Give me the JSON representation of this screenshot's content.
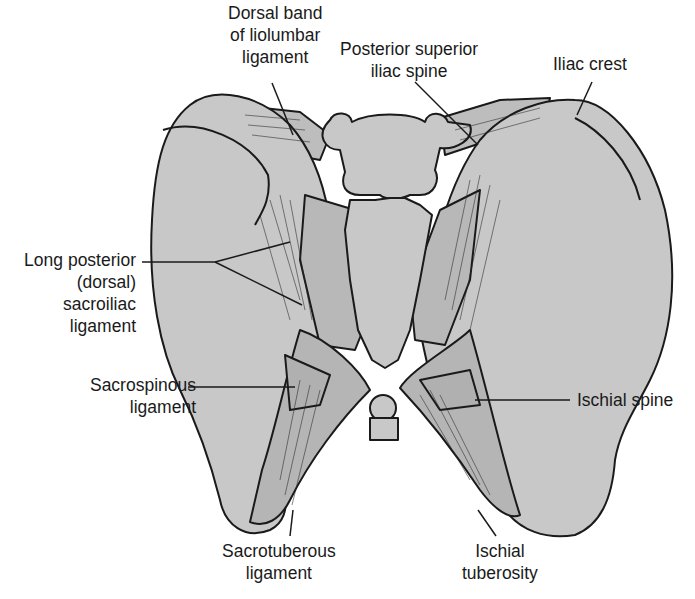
{
  "figure": {
    "colors": {
      "bone_fill": "#c8c8c8",
      "ligament_fill": "#bdbdbd",
      "outline": "#1a1a1a",
      "background": "#ffffff",
      "label_text": "#1a1a1a"
    }
  },
  "labels": {
    "dorsal_band": {
      "lines": [
        "Dorsal band",
        "of liolumbar",
        "ligament"
      ]
    },
    "psis": {
      "lines": [
        "Posterior superior",
        "iliac spine"
      ]
    },
    "iliac_crest": {
      "lines": [
        "Iliac crest"
      ]
    },
    "long_posterior": {
      "lines": [
        "Long posterior",
        "(dorsal)",
        "sacroiliac",
        "ligament"
      ]
    },
    "sacrospinous": {
      "lines": [
        "Sacrospinous",
        "ligament"
      ]
    },
    "ischial_spine": {
      "lines": [
        "Ischial spine"
      ]
    },
    "sacrotuberous": {
      "lines": [
        "Sacrotuberous",
        "ligament"
      ]
    },
    "ischial_tuberosity": {
      "lines": [
        "Ischial",
        "tuberosity"
      ]
    }
  }
}
